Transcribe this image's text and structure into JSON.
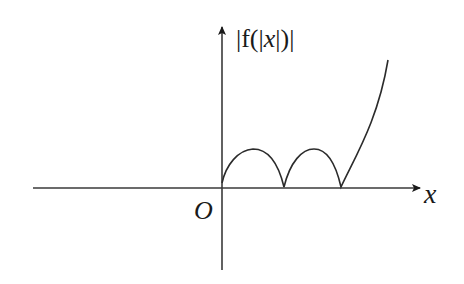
{
  "figure": {
    "y_axis_label": "|f(|x|)|",
    "y_label_parts": [
      "|f(|",
      "x",
      "|)|"
    ],
    "x_axis_label": "x",
    "origin_label": "O",
    "stroke_color": "#2b2b2b"
  }
}
